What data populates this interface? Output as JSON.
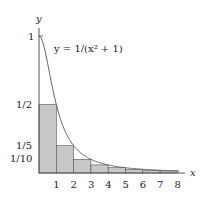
{
  "diagram": {
    "axis_labels": {
      "x": "x",
      "y": "y"
    },
    "function_label": "y = 1/(x² + 1)",
    "y_ticks": [
      {
        "value": 1,
        "label": "1"
      },
      {
        "value": 0.5,
        "label": "1/2"
      },
      {
        "value": 0.2,
        "label": "1/5"
      },
      {
        "value": 0.1,
        "label": "1/10"
      }
    ],
    "x_ticks": [
      "1",
      "2",
      "3",
      "4",
      "5",
      "6",
      "7",
      "8"
    ],
    "colors": {
      "bar_fill": "#c8c8c8",
      "bar_stroke": "#555555",
      "curve": "#555555",
      "axis": "#444444"
    }
  },
  "chart_data": {
    "type": "bar",
    "xlabel": "x",
    "ylabel": "y",
    "categories": [
      "[0,1]",
      "[1,2]",
      "[2,3]",
      "[3,4]",
      "[4,5]",
      "[5,6]",
      "[6,7]",
      "[7,8]"
    ],
    "values": [
      0.5,
      0.2,
      0.1,
      0.0588,
      0.0385,
      0.027,
      0.02,
      0.0154
    ],
    "curve": "y = 1/(x^2+1)",
    "xlim": [
      0,
      8.5
    ],
    "ylim": [
      0,
      1
    ]
  }
}
